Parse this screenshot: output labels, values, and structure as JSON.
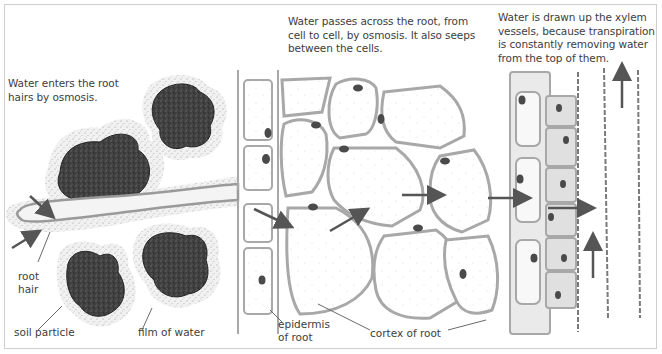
{
  "diagram": {
    "captions": {
      "root_hairs": "Water enters the root\nhairs by osmosis.",
      "across_root": "Water passes across the root, from\ncell to cell, by osmosis. It also seeps\nbetween the cells.",
      "xylem": "Water is drawn up the xylem\nvessels, because transpiration\nis constantly removing water\nfrom the top of them."
    },
    "labels": {
      "root_hair": "root\nhair",
      "soil_particle": "soil particle",
      "film_of_water": "film of water",
      "epidermis": "epidermis\nof root",
      "cortex": "cortex of root"
    },
    "colors": {
      "frame": "#cfcfcf",
      "soil": "#3b3b3b",
      "water_film": "#e6e6e6",
      "cell_wall": "#a8a8a8",
      "cytoplasm": "#dcdcdc",
      "nucleus": "#4a4a4a",
      "arrow": "#555555",
      "text": "#3d3d3d"
    },
    "arrows": [
      {
        "name": "into-root-hair-top",
        "direction": "down-right"
      },
      {
        "name": "into-root-hair-bottom",
        "direction": "up-right"
      },
      {
        "name": "epidermis-to-cortex",
        "direction": "down-right"
      },
      {
        "name": "cortex-1",
        "direction": "up-right"
      },
      {
        "name": "cortex-2",
        "direction": "right"
      },
      {
        "name": "cortex-to-endodermis",
        "direction": "right"
      },
      {
        "name": "into-xylem",
        "direction": "right"
      },
      {
        "name": "xylem-up-lower",
        "direction": "up"
      },
      {
        "name": "xylem-up-upper",
        "direction": "up"
      }
    ]
  }
}
